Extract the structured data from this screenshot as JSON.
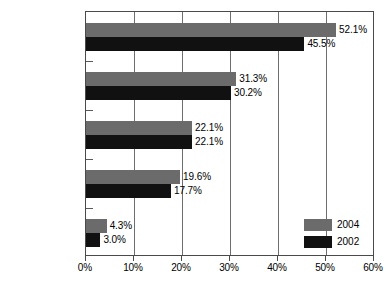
{
  "chart_data": {
    "type": "bar",
    "orientation": "horizontal",
    "title": "",
    "subtitle": "",
    "xlabel": "",
    "ylabel": "",
    "xlim": [
      0,
      60
    ],
    "grid": true,
    "grid_axis": "x",
    "legend_position": "bottom-right-inside",
    "categories": [
      "Billing",
      "Check tamp",
      "Expense reimb",
      "Payroll",
      "Register disb"
    ],
    "xticks": [
      0,
      10,
      20,
      30,
      40,
      50,
      60
    ],
    "xtick_labels": [
      "0%",
      "10%",
      "20%",
      "30%",
      "40%",
      "50%",
      "60%"
    ],
    "series": [
      {
        "name": "2004",
        "color": "#6b6b6b",
        "values": [
          52.1,
          31.3,
          22.1,
          19.6,
          4.3
        ],
        "value_labels": [
          "52.1%",
          "31.3%",
          "22.1%",
          "19.6%",
          "4.3%"
        ]
      },
      {
        "name": "2002",
        "color": "#111111",
        "values": [
          45.5,
          30.2,
          22.1,
          17.7,
          3.0
        ],
        "value_labels": [
          "45.5%",
          "30.2%",
          "22.1%",
          "17.7%",
          "3.0%"
        ]
      }
    ]
  },
  "legend": {
    "entries": [
      {
        "label": "2004",
        "color": "#6b6b6b"
      },
      {
        "label": "2002",
        "color": "#111111"
      }
    ]
  },
  "colors": {
    "series_2004": "#6b6b6b",
    "series_2002": "#111111",
    "axis": "#4a4a4a",
    "gridline": "#6e6e6e",
    "background": "#ffffff",
    "text": "#000000"
  }
}
